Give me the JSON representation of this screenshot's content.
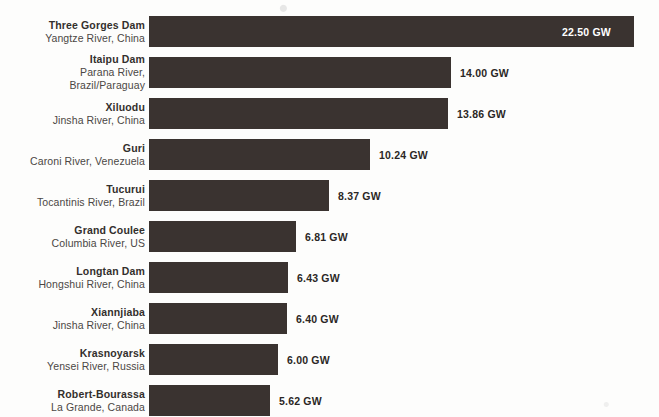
{
  "chart_data": {
    "type": "bar",
    "orientation": "horizontal",
    "title": "",
    "subtitle": "",
    "xlabel": "",
    "ylabel": "",
    "unit": "GW",
    "grid": false,
    "legend": false,
    "xlim": [
      0,
      22.5
    ],
    "axis_visible": false,
    "bar_color": "#3a3330",
    "background_color": "#fdfdfc",
    "label_color": "#44403c",
    "value_label_color": "#2b2725",
    "value_label_inside_color": "#ffffff",
    "categories": [
      "Three Gorges Dam",
      "Itaipu Dam",
      "Xiluodu",
      "Guri",
      "Tucurui",
      "Grand Coulee",
      "Longtan Dam",
      "Xiannjiaba",
      "Krasnoyarsk",
      "Robert-Bourassa"
    ],
    "values": [
      22.5,
      14.0,
      13.86,
      10.24,
      8.37,
      6.81,
      6.43,
      6.4,
      6.0,
      5.62
    ],
    "value_labels": [
      "22.50 GW",
      "14.00 GW",
      "13.86 GW",
      "10.24 GW",
      "8.37 GW",
      "6.81 GW",
      "6.43 GW",
      "6.40 GW",
      "6.00 GW",
      "5.62 GW"
    ],
    "sublabels": [
      [
        "Yangtze River, China"
      ],
      [
        "Parana River,",
        "Brazil/Paraguay"
      ],
      [
        "Jinsha River, China"
      ],
      [
        "Caroni River, Venezuela"
      ],
      [
        "Tocantinis River, Brazil"
      ],
      [
        "Columbia River, US"
      ],
      [
        "Hongshui River, China"
      ],
      [
        "Jinsha River, China"
      ],
      [
        "Yensei River, Russia"
      ],
      [
        "La Grande, Canada"
      ]
    ]
  },
  "rows": [
    {
      "name": "Three Gorges Dam",
      "river": "Yangtze River, China",
      "river_line2": "",
      "value": "22.50 GW",
      "value_inside": true
    },
    {
      "name": "Itaipu Dam",
      "river": "Parana River,",
      "river_line2": "Brazil/Paraguay",
      "value": "14.00 GW",
      "value_inside": false
    },
    {
      "name": "Xiluodu",
      "river": "Jinsha River, China",
      "river_line2": "",
      "value": "13.86 GW",
      "value_inside": false
    },
    {
      "name": "Guri",
      "river": "Caroni River, Venezuela",
      "river_line2": "",
      "value": "10.24 GW",
      "value_inside": false
    },
    {
      "name": "Tucurui",
      "river": "Tocantinis River, Brazil",
      "river_line2": "",
      "value": "8.37 GW",
      "value_inside": false
    },
    {
      "name": "Grand Coulee",
      "river": "Columbia River, US",
      "river_line2": "",
      "value": "6.81 GW",
      "value_inside": false
    },
    {
      "name": "Longtan Dam",
      "river": "Hongshui River, China",
      "river_line2": "",
      "value": "6.43 GW",
      "value_inside": false
    },
    {
      "name": "Xiannjiaba",
      "river": "Jinsha River, China",
      "river_line2": "",
      "value": "6.40 GW",
      "value_inside": false
    },
    {
      "name": "Krasnoyarsk",
      "river": "Yensei River, Russia",
      "river_line2": "",
      "value": "6.00 GW",
      "value_inside": false
    },
    {
      "name": "Robert-Bourassa",
      "river": "La Grande, Canada",
      "river_line2": "",
      "value": "5.62 GW",
      "value_inside": false
    }
  ],
  "layout": {
    "bar_origin_x": 149,
    "px_per_gw": 21.55,
    "bar_height": 31,
    "row_tops": [
      16,
      57,
      98,
      139,
      180,
      221,
      262,
      303,
      344,
      385
    ]
  }
}
